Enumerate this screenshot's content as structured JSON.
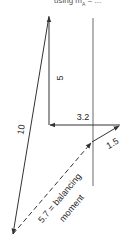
{
  "caption": {
    "prefix": "using m",
    "subscript": "A",
    "suffix": "= ..."
  },
  "colors": {
    "line": "#333333",
    "reference_line": "#444444",
    "text": "#222222",
    "background": "#ffffff"
  },
  "vectors": [
    {
      "id": "v5",
      "label": "5",
      "from": [
        49,
        125
      ],
      "to": [
        49,
        16
      ],
      "style": "solid"
    },
    {
      "id": "v3_2",
      "label": "3.2",
      "from": [
        120,
        125
      ],
      "to": [
        49,
        125
      ],
      "style": "solid"
    },
    {
      "id": "v1_5",
      "label": "1.5",
      "from": [
        92,
        142
      ],
      "to": [
        120,
        125
      ],
      "style": "solid"
    },
    {
      "id": "v10",
      "label": "10",
      "from": [
        49,
        16
      ],
      "to": [
        12,
        235
      ],
      "style": "solid"
    },
    {
      "id": "v5_7",
      "label": "5.7 = balancing",
      "label2": "moment",
      "from": [
        12,
        235
      ],
      "to": [
        92,
        142
      ],
      "style": "dashed"
    }
  ],
  "labels": {
    "v5": "5",
    "v3_2": "3.2",
    "v1_5": "1.5",
    "v10": "10",
    "v5_7_line1": "5.7 = balancing",
    "v5_7_line2": "moment"
  },
  "reference_line": {
    "x": 93,
    "y1": 18,
    "y2": 186
  }
}
